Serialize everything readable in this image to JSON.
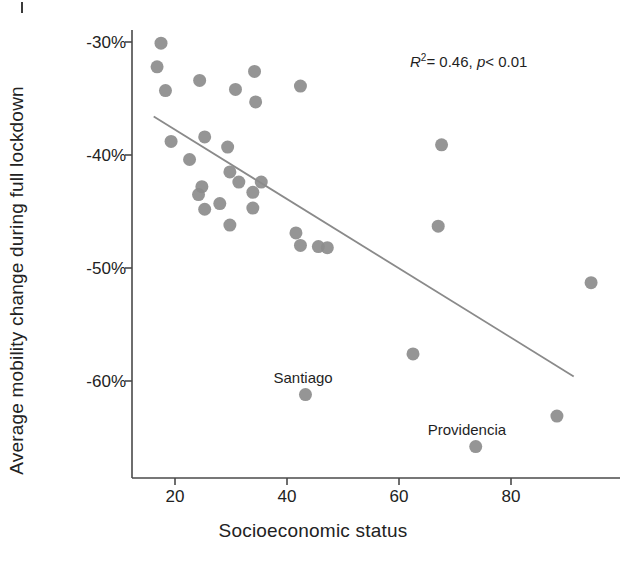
{
  "figure": {
    "title": "",
    "annotation": {
      "r_squared_symbol": "R",
      "r_squared_exponent": "2",
      "r_squared_value": "= 0.46,",
      "p_symbol": "p",
      "p_value": "< 0.01",
      "full_text": "R2 = 0.46, p < 0.01"
    },
    "corner_mark": ""
  },
  "chart_data": {
    "type": "scatter",
    "title": "",
    "xlabel": "Socioeconomic status",
    "ylabel": "Average mobility change during full lockdown",
    "xlim": [
      13,
      98
    ],
    "ylim": [
      -68.5,
      -28.0
    ],
    "grid": false,
    "legend": null,
    "xticks": [
      20,
      40,
      60,
      80
    ],
    "xtick_labels": [
      "20",
      "40",
      "60",
      "80"
    ],
    "yticks": [
      -30,
      -40,
      -50,
      -60
    ],
    "ytick_labels": [
      "-30%",
      "-40%",
      "-50%",
      "-60%"
    ],
    "marker_color": "#8c8c8c",
    "marker_size": 13,
    "points": [
      {
        "x": 17.5,
        "y": -30.1,
        "label": null
      },
      {
        "x": 16.8,
        "y": -32.2,
        "label": null
      },
      {
        "x": 18.3,
        "y": -34.3,
        "label": null
      },
      {
        "x": 24.4,
        "y": -33.4,
        "label": null
      },
      {
        "x": 30.8,
        "y": -34.2,
        "label": null
      },
      {
        "x": 34.2,
        "y": -32.6,
        "label": null
      },
      {
        "x": 34.4,
        "y": -35.3,
        "label": null
      },
      {
        "x": 42.4,
        "y": -33.9,
        "label": null
      },
      {
        "x": 19.3,
        "y": -38.8,
        "label": null
      },
      {
        "x": 25.3,
        "y": -38.4,
        "label": null
      },
      {
        "x": 22.6,
        "y": -40.4,
        "label": null
      },
      {
        "x": 29.4,
        "y": -39.3,
        "label": null
      },
      {
        "x": 29.8,
        "y": -41.5,
        "label": null
      },
      {
        "x": 24.8,
        "y": -42.8,
        "label": null
      },
      {
        "x": 24.2,
        "y": -43.5,
        "label": null
      },
      {
        "x": 31.4,
        "y": -42.4,
        "label": null
      },
      {
        "x": 33.9,
        "y": -43.3,
        "label": null
      },
      {
        "x": 25.3,
        "y": -44.8,
        "label": null
      },
      {
        "x": 28.0,
        "y": -44.3,
        "label": null
      },
      {
        "x": 33.9,
        "y": -44.7,
        "label": null
      },
      {
        "x": 29.8,
        "y": -46.2,
        "label": null
      },
      {
        "x": 35.4,
        "y": -42.4,
        "label": null
      },
      {
        "x": 41.6,
        "y": -46.9,
        "label": null
      },
      {
        "x": 42.4,
        "y": -48.0,
        "label": null
      },
      {
        "x": 45.6,
        "y": -48.1,
        "label": null
      },
      {
        "x": 47.2,
        "y": -48.2,
        "label": null
      },
      {
        "x": 67.6,
        "y": -39.1,
        "label": null
      },
      {
        "x": 67.0,
        "y": -46.3,
        "label": null
      },
      {
        "x": 94.3,
        "y": -51.3,
        "label": null
      },
      {
        "x": 62.5,
        "y": -57.6,
        "label": null
      },
      {
        "x": 43.3,
        "y": -61.2,
        "label": null
      },
      {
        "x": 88.2,
        "y": -63.1,
        "label": null
      },
      {
        "x": 73.7,
        "y": -65.8,
        "label": null
      }
    ],
    "annotated_points": [
      {
        "name": "Santiago",
        "x": 43.3,
        "y": -61.2
      },
      {
        "name": "Providencia",
        "x": 73.7,
        "y": -65.8
      }
    ],
    "trendline": {
      "type": "linear",
      "color": "#8a8a8a",
      "x_start": 16.2,
      "y_start": -36.6,
      "x_end": 91.2,
      "y_end": -59.6,
      "r_squared": 0.46,
      "p_value": "< 0.01"
    }
  }
}
